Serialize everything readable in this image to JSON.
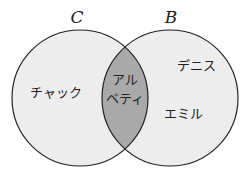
{
  "diagram": {
    "type": "venn",
    "colors": {
      "circle_fill": "#ededed",
      "intersection_fill": "#a9a9a9",
      "stroke": "#222222"
    },
    "sets": [
      {
        "name": "C",
        "only_members": [
          "チャック"
        ]
      },
      {
        "name": "B",
        "only_members": [
          "デニス",
          "エミル"
        ]
      }
    ],
    "intersection": {
      "line1": "アル",
      "line2": "ベティ"
    },
    "labels": {
      "left_set": "C",
      "right_set": "B",
      "left_only": "チャック",
      "right_top": "デニス",
      "right_bottom": "エミル"
    }
  }
}
